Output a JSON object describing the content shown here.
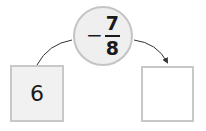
{
  "diagram": {
    "type": "function-machine",
    "input_box": {
      "value": "6"
    },
    "operator": {
      "sign": "−",
      "numerator": "7",
      "denominator": "8",
      "expression": "−7/8"
    },
    "output_box": {
      "value": ""
    },
    "colors": {
      "box_border": "#c8c8c8",
      "input_fill": "#f1f1f1",
      "circle_fill": "#efefef",
      "arrow": "#333333"
    }
  }
}
